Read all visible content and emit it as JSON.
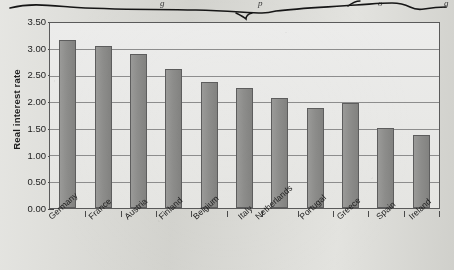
{
  "scan": {
    "annotation_name": "handwritten-ink-stroke",
    "top_fragments": [
      "g",
      "p",
      "o",
      "g"
    ],
    "page_background": "#dbdbd6",
    "ink_color": "#1a1a1a"
  },
  "chart_data": {
    "type": "bar",
    "title": "",
    "xlabel": "",
    "ylabel": "Real interest rate",
    "ylim": [
      0,
      3.5
    ],
    "ytick_step": 0.5,
    "grid": true,
    "legend": "none",
    "bar_color": "#8d8d8b",
    "bar_border_color": "#5d5d5d",
    "plot_background": "#e9e9e7",
    "axis_color": "#5a5a5a",
    "ytick_labels": [
      "3.50",
      "3.00",
      "2.50",
      "2.00",
      "1.50",
      "1.00",
      "0.50",
      "0.00"
    ],
    "categories": [
      "Germany",
      "France",
      "Austria",
      "Finland",
      "Belgium",
      "Italy",
      "Netherlands",
      "Portugal",
      "Greece",
      "Spain",
      "Ireland"
    ],
    "values": [
      3.17,
      3.06,
      2.91,
      2.63,
      2.38,
      2.27,
      2.08,
      1.9,
      1.99,
      1.52,
      1.39
    ]
  }
}
